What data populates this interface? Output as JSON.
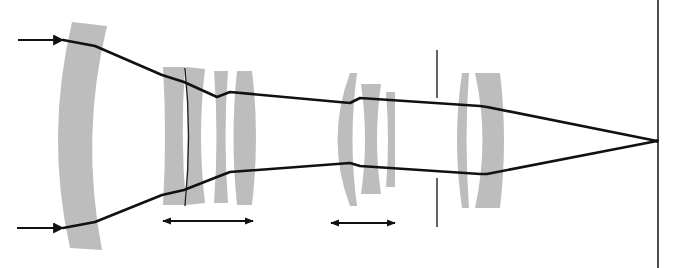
{
  "diagram": {
    "title": "",
    "type": "zoom-lens-optical-ray-diagram",
    "colors": {
      "lens_fill": "#bdbdbd",
      "ray": "#111111",
      "background": "#ffffff"
    },
    "elements": [
      {
        "name": "input-ray-arrow-top",
        "y": 40
      },
      {
        "name": "input-ray-arrow-bottom",
        "y": 228
      },
      {
        "name": "front-meniscus-lens",
        "x_range": [
          55,
          100
        ]
      },
      {
        "name": "moving-group-2",
        "x_range": [
          162,
          255
        ],
        "movement": "bidirectional"
      },
      {
        "name": "moving-group-3",
        "x_range": [
          330,
          395
        ],
        "movement": "bidirectional"
      },
      {
        "name": "aperture-stop",
        "x": 437
      },
      {
        "name": "rear-group",
        "x_range": [
          455,
          503
        ]
      },
      {
        "name": "focal-point",
        "x": 657,
        "y": 141
      },
      {
        "name": "image-plane",
        "x": 658
      }
    ],
    "labels": []
  }
}
